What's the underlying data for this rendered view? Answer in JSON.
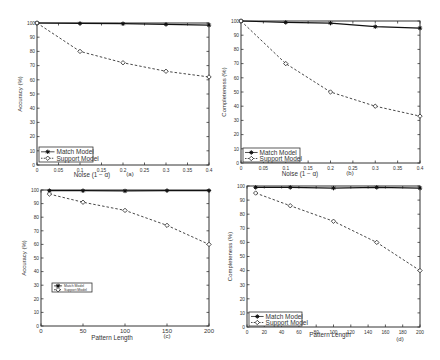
{
  "chart_data": [
    {
      "type": "line",
      "panel": "(a)",
      "title": "",
      "xlabel": "Noise (1 − α)",
      "ylabel": "Accuracy (%)",
      "x": [
        0,
        0.1,
        0.2,
        0.3,
        0.4
      ],
      "xticks": [
        "0",
        "0.05",
        "0.1",
        "0.15",
        "0.2",
        "0.25",
        "0.3",
        "0.35",
        "0.4"
      ],
      "xtick_values": [
        0,
        0.05,
        0.1,
        0.15,
        0.2,
        0.25,
        0.3,
        0.35,
        0.4
      ],
      "yticks": [
        "0",
        "10",
        "20",
        "30",
        "40",
        "50",
        "60",
        "70",
        "80",
        "90",
        "100"
      ],
      "xlim": [
        0,
        0.4
      ],
      "ylim": [
        0,
        100
      ],
      "grid": false,
      "legend_position": "lower left",
      "series": [
        {
          "name": "Match Model",
          "style": "solid",
          "marker": "*",
          "values": [
            100,
            99.7,
            99.5,
            99,
            98.5
          ]
        },
        {
          "name": "Support Model",
          "style": "dashed",
          "marker": "diamond",
          "values": [
            100,
            80,
            72,
            66,
            62
          ]
        }
      ]
    },
    {
      "type": "line",
      "panel": "(b)",
      "title": "",
      "xlabel": "Noise (1 − α)",
      "ylabel": "Completeness (%)",
      "x": [
        0,
        0.1,
        0.2,
        0.3,
        0.4
      ],
      "xticks": [
        "0",
        "0.05",
        "0.1",
        "0.15",
        "0.2",
        "0.25",
        "0.3",
        "0.35",
        "0.4"
      ],
      "xtick_values": [
        0,
        0.05,
        0.1,
        0.15,
        0.2,
        0.25,
        0.3,
        0.35,
        0.4
      ],
      "yticks": [
        "0",
        "10",
        "20",
        "30",
        "40",
        "50",
        "60",
        "70",
        "80",
        "90",
        "100"
      ],
      "xlim": [
        0,
        0.4
      ],
      "ylim": [
        0,
        100
      ],
      "grid": false,
      "legend_position": "lower left",
      "series": [
        {
          "name": "Match Model",
          "style": "solid",
          "marker": "*",
          "values": [
            100,
            99,
            98.5,
            96,
            95
          ]
        },
        {
          "name": "Support Model",
          "style": "dashed",
          "marker": "diamond",
          "values": [
            100,
            70,
            50,
            40,
            33
          ]
        }
      ]
    },
    {
      "type": "line",
      "panel": "(c)",
      "title": "",
      "xlabel": "Pattern Length",
      "ylabel": "Accuracy (%)",
      "x": [
        10,
        50,
        100,
        150,
        200
      ],
      "xticks": [
        "0",
        "50",
        "100",
        "150",
        "200"
      ],
      "xtick_values": [
        0,
        50,
        100,
        150,
        200
      ],
      "yticks": [
        "0",
        "10",
        "20",
        "30",
        "40",
        "50",
        "60",
        "70",
        "80",
        "90",
        "100"
      ],
      "xlim": [
        0,
        200
      ],
      "ylim": [
        0,
        100
      ],
      "grid": false,
      "legend_position": "center left",
      "series": [
        {
          "name": "Match Model",
          "style": "solid",
          "marker": "*",
          "values": [
            99.5,
            99.5,
            99.3,
            99.6,
            99.6
          ]
        },
        {
          "name": "Support Model",
          "style": "dashed",
          "marker": "diamond",
          "values": [
            97,
            91,
            85,
            74,
            60
          ]
        }
      ]
    },
    {
      "type": "line",
      "panel": "(d)",
      "title": "",
      "xlabel": "Pattern Length",
      "ylabel": "Completeness (%)",
      "x": [
        10,
        50,
        100,
        150,
        200
      ],
      "xticks": [
        "0",
        "20",
        "40",
        "60",
        "80",
        "100",
        "120",
        "140",
        "160",
        "180",
        "200"
      ],
      "xtick_values": [
        0,
        20,
        40,
        60,
        80,
        100,
        120,
        140,
        160,
        180,
        200
      ],
      "yticks": [
        "0",
        "10",
        "20",
        "30",
        "40",
        "50",
        "60",
        "70",
        "80",
        "90",
        "100"
      ],
      "xlim": [
        0,
        200
      ],
      "ylim": [
        0,
        100
      ],
      "grid": false,
      "legend_position": "lower left",
      "series": [
        {
          "name": "Match Model",
          "style": "solid",
          "marker": "*",
          "values": [
            99,
            99,
            98.5,
            99,
            98.5
          ]
        },
        {
          "name": "Support Model",
          "style": "dashed",
          "marker": "diamond",
          "values": [
            95,
            86,
            75,
            60,
            40
          ]
        }
      ]
    }
  ],
  "layout": [
    {
      "left": 37,
      "top": 23,
      "right": 209,
      "bottom": 165,
      "legend": {
        "x": 39,
        "y": 147,
        "w": 54,
        "h": 15,
        "size": 6.5
      },
      "panel_label_x": 130,
      "panel_label_y": 176,
      "xlabel_x": 92,
      "xlabel_y": 177
    },
    {
      "left": 241,
      "top": 21,
      "right": 420,
      "bottom": 163,
      "legend": {
        "x": 243,
        "y": 148,
        "w": 57,
        "h": 14,
        "size": 6.5
      },
      "panel_label_x": 350,
      "panel_label_y": 175,
      "xlabel_x": 300,
      "xlabel_y": 176
    },
    {
      "left": 41,
      "top": 190,
      "right": 209,
      "bottom": 326,
      "legend": {
        "x": 52,
        "y": 283,
        "w": 40,
        "h": 9,
        "size": 3.5
      },
      "panel_label_x": 167,
      "panel_label_y": 338,
      "xlabel_x": 112,
      "xlabel_y": 340
    },
    {
      "left": 247,
      "top": 186,
      "right": 420,
      "bottom": 327,
      "legend": {
        "x": 249,
        "y": 312,
        "w": 53,
        "h": 14,
        "size": 6.5
      },
      "panel_label_x": 400,
      "panel_label_y": 341,
      "xlabel_x": 330,
      "xlabel_y": 337
    }
  ]
}
